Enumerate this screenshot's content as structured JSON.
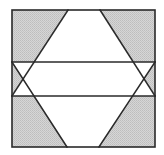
{
  "figure": {
    "colors": {
      "stroke": "#2a2a2a",
      "shade": "#cdcdcd",
      "background": "#ffffff"
    },
    "square": {
      "x1": 12,
      "y1": 10,
      "x2": 155,
      "y2": 147
    },
    "horizontal_lines_y": [
      62,
      96
    ],
    "diagonals": [
      {
        "from": [
          68,
          10
        ],
        "to": [
          12,
          96
        ]
      },
      {
        "from": [
          100,
          10
        ],
        "to": [
          155,
          96
        ]
      },
      {
        "from": [
          67,
          147
        ],
        "to": [
          12,
          62
        ]
      },
      {
        "from": [
          99,
          147
        ],
        "to": [
          155,
          62
        ]
      }
    ]
  }
}
